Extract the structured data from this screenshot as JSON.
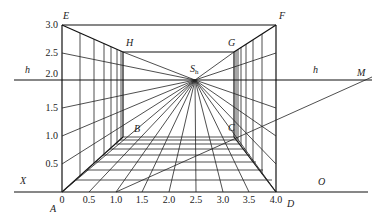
{
  "diagram": {
    "title": "",
    "points": {
      "A": "A",
      "B": "B",
      "C": "C",
      "D": "D",
      "E": "E",
      "F": "F",
      "G": "G",
      "H": "H",
      "M": "M",
      "O": "O",
      "X": "X",
      "Sh_main": "S",
      "Sh_sub": "h"
    },
    "horizon_labels": [
      "h",
      "h"
    ],
    "x_ticks": [
      "0",
      "0.5",
      "1.0",
      "1.5",
      "2.0",
      "2.5",
      "3.0",
      "3.5",
      "4.0"
    ],
    "y_ticks": [
      "3.0",
      "2.5",
      "2.0",
      "1.5",
      "1.0",
      "0.5"
    ]
  }
}
